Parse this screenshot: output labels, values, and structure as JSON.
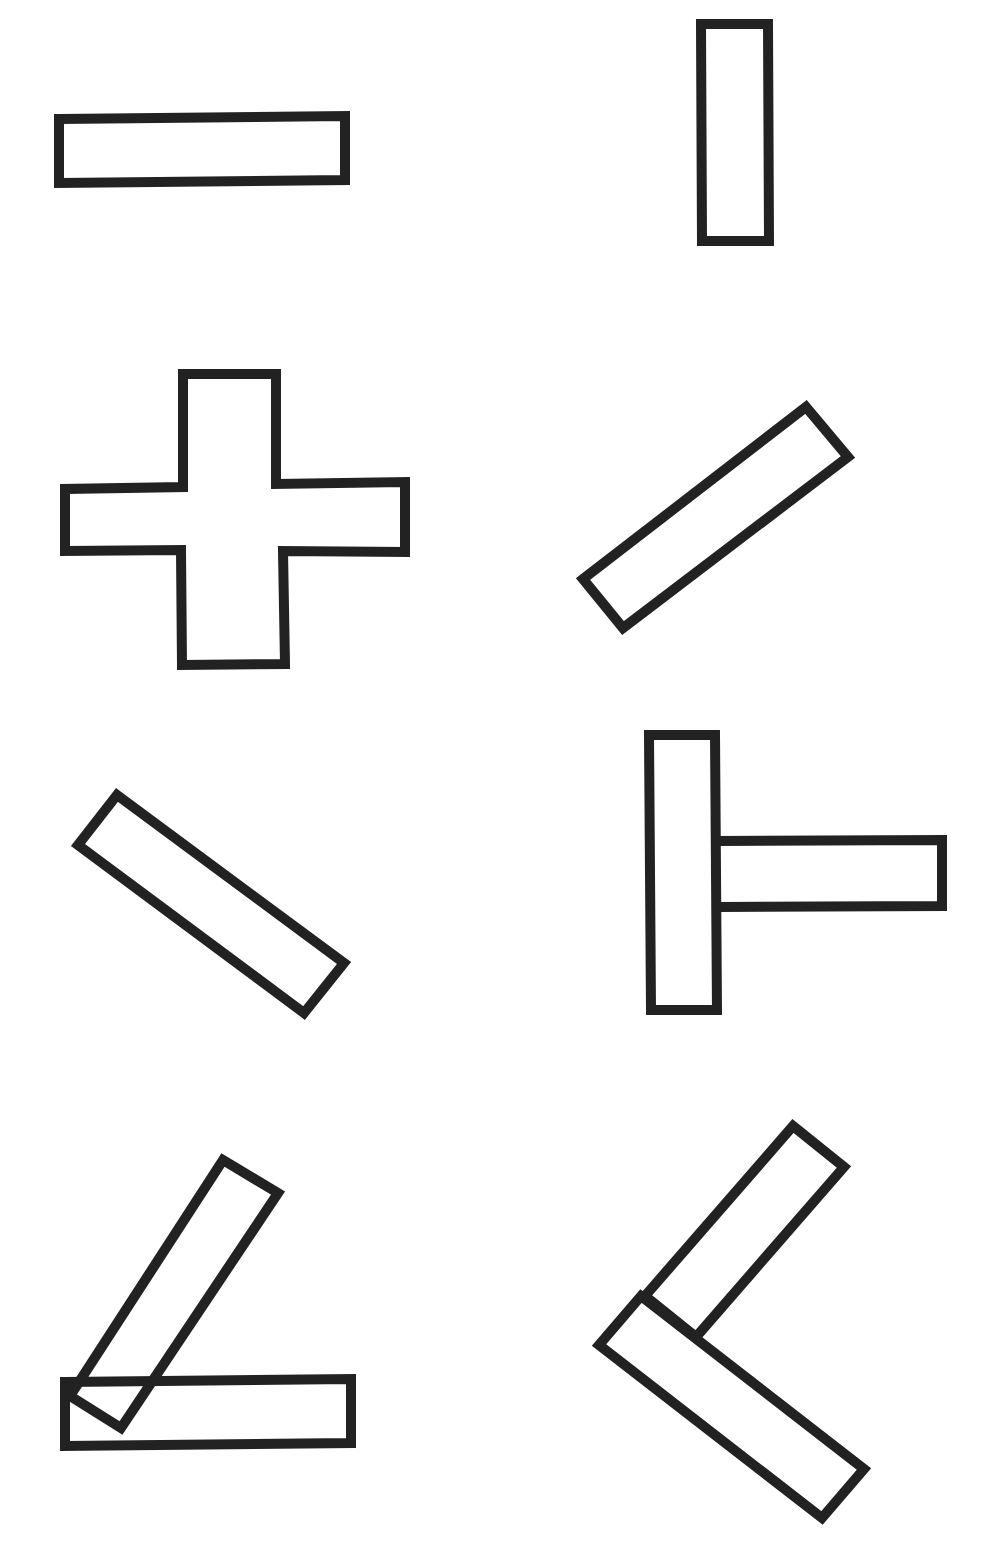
{
  "diagram": {
    "background": "#ffffff",
    "stroke_color": "#222222",
    "stroke_width": 10,
    "shapes": [
      {
        "id": "bar-horizontal-top-left",
        "kind": "rectangle",
        "points": [
          [
            59,
            119
          ],
          [
            345,
            116
          ],
          [
            345,
            180
          ],
          [
            59,
            183
          ]
        ],
        "fill": true
      },
      {
        "id": "bar-vertical-top-right",
        "kind": "rectangle",
        "points": [
          [
            701,
            24
          ],
          [
            768,
            24
          ],
          [
            769,
            241
          ],
          [
            702,
            241
          ]
        ],
        "fill": true
      },
      {
        "id": "plus-cross",
        "kind": "cross",
        "points": [
          [
            183,
            374
          ],
          [
            276,
            374
          ],
          [
            276,
            484
          ],
          [
            405,
            482
          ],
          [
            405,
            552
          ],
          [
            283,
            551
          ],
          [
            285,
            664
          ],
          [
            182,
            665
          ],
          [
            181,
            550
          ],
          [
            65,
            551
          ],
          [
            65,
            489
          ],
          [
            183,
            487
          ]
        ],
        "fill": true
      },
      {
        "id": "bar-diagonal-up-right",
        "kind": "rectangle",
        "points": [
          [
            583,
            579
          ],
          [
            806,
            407
          ],
          [
            848,
            457
          ],
          [
            623,
            628
          ]
        ],
        "fill": true
      },
      {
        "id": "bar-diagonal-down-right",
        "kind": "rectangle",
        "points": [
          [
            117,
            795
          ],
          [
            344,
            963
          ],
          [
            304,
            1013
          ],
          [
            78,
            845
          ]
        ],
        "fill": true
      },
      {
        "id": "t-shape-vertical",
        "kind": "rectangle",
        "points": [
          [
            649,
            735
          ],
          [
            715,
            735
          ],
          [
            717,
            1010
          ],
          [
            651,
            1010
          ]
        ],
        "fill": true
      },
      {
        "id": "t-shape-horizontal",
        "kind": "rectangle",
        "points": [
          [
            716,
            841
          ],
          [
            942,
            840
          ],
          [
            942,
            906
          ],
          [
            718,
            907
          ]
        ],
        "fill": false,
        "open_left": true
      },
      {
        "id": "angle-horizontal-bar",
        "kind": "rectangle",
        "points": [
          [
            65,
            1382
          ],
          [
            351,
            1379
          ],
          [
            351,
            1443
          ],
          [
            65,
            1446
          ]
        ],
        "fill": true
      },
      {
        "id": "angle-tilted-bar",
        "kind": "rectangle",
        "points": [
          [
            223,
            1160
          ],
          [
            278,
            1193
          ],
          [
            121,
            1428
          ],
          [
            70,
            1396
          ]
        ],
        "fill": false
      },
      {
        "id": "l-upper-bar",
        "kind": "rectangle",
        "points": [
          [
            793,
            1126
          ],
          [
            844,
            1167
          ],
          [
            696,
            1337
          ],
          [
            645,
            1296
          ]
        ],
        "fill": true
      },
      {
        "id": "l-lower-bar",
        "kind": "rectangle",
        "points": [
          [
            641,
            1296
          ],
          [
            864,
            1469
          ],
          [
            822,
            1518
          ],
          [
            599,
            1345
          ]
        ],
        "fill": true
      }
    ]
  }
}
